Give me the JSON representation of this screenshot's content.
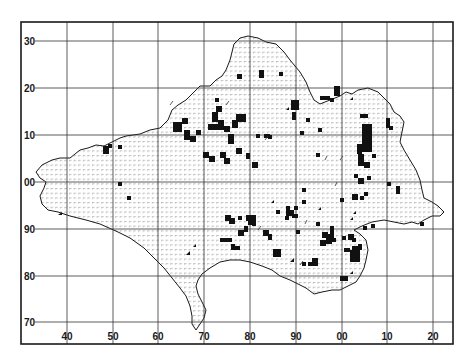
{
  "map": {
    "type": "distribution-grid-map",
    "frame": {
      "x": 21,
      "y": 22,
      "width": 432,
      "height": 322
    },
    "grid": {
      "x_labels": [
        "40",
        "50",
        "60",
        "70",
        "80",
        "90",
        "00",
        "10",
        "20"
      ],
      "x_positions": [
        67,
        113,
        158,
        204,
        250,
        296,
        342,
        387,
        433
      ],
      "y_labels": [
        "30",
        "20",
        "10",
        "00",
        "90",
        "80",
        "70"
      ],
      "y_positions": [
        41,
        88,
        135,
        182,
        229,
        276,
        322
      ]
    },
    "colors": {
      "ink": "#1a1a1a",
      "grid": "#333333",
      "hatch": "#9a9a9a",
      "background": "#ffffff"
    },
    "legend": {
      "filled_square": "record present (tetrad)",
      "triangle": "partial / older record"
    }
  }
}
